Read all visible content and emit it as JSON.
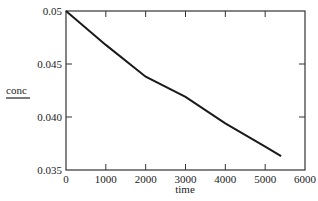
{
  "chart_data": {
    "type": "line",
    "title": "",
    "xlabel": "time",
    "ylabel": "conc",
    "xlim": [
      0,
      6000
    ],
    "ylim": [
      0.035,
      0.05
    ],
    "x_ticks": [
      "0",
      "1000",
      "2000",
      "3000",
      "4000",
      "5000",
      "6000"
    ],
    "y_ticks": [
      "0.035",
      "0.040",
      "0.045",
      "0.05"
    ],
    "grid": false,
    "legend": null,
    "series": [
      {
        "name": "conc",
        "x": [
          0,
          1000,
          2000,
          3000,
          4000,
          5000,
          5400
        ],
        "y": [
          0.05,
          0.0468,
          0.0438,
          0.0419,
          0.0394,
          0.0372,
          0.0363
        ]
      }
    ],
    "line_color": "#1a1a1a"
  }
}
